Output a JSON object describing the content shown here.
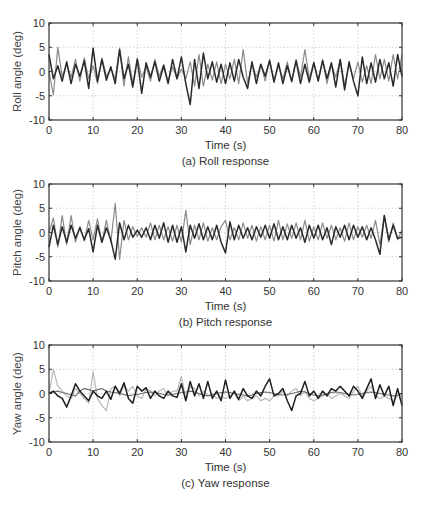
{
  "chart_data": [
    {
      "type": "line",
      "title": "(a) Roll response",
      "xlabel": "Time (s)",
      "ylabel": "Roll angle (deg)",
      "xlim": [
        0,
        80
      ],
      "ylim": [
        -10,
        10
      ],
      "xticks": [
        0,
        10,
        20,
        30,
        40,
        50,
        60,
        70,
        80
      ],
      "yticks": [
        10,
        5,
        0,
        -5,
        -10
      ],
      "grid": true,
      "x": [
        0,
        1,
        2,
        3,
        4,
        5,
        6,
        7,
        8,
        9,
        10,
        11,
        12,
        13,
        14,
        15,
        16,
        17,
        18,
        19,
        20,
        21,
        22,
        23,
        24,
        25,
        26,
        27,
        28,
        29,
        30,
        31,
        32,
        33,
        34,
        35,
        36,
        37,
        38,
        39,
        40,
        41,
        42,
        43,
        44,
        45,
        46,
        47,
        48,
        49,
        50,
        51,
        52,
        53,
        54,
        55,
        56,
        57,
        58,
        59,
        60,
        61,
        62,
        63,
        64,
        65,
        66,
        67,
        68,
        69,
        70,
        71,
        72,
        73,
        74,
        75,
        76,
        77,
        78,
        79,
        80
      ],
      "series": [
        {
          "name": "series-1",
          "color": "#2a2a2a",
          "values": [
            3.5,
            -1.5,
            1.2,
            -2,
            2,
            -2.5,
            1.5,
            -1,
            2.2,
            -3.5,
            4.8,
            -2,
            2.5,
            -1.8,
            1,
            -2.5,
            4.5,
            -1.5,
            1.5,
            -3.2,
            2.5,
            -4.5,
            1.8,
            -1.2,
            2,
            -2,
            1.2,
            -2.5,
            2.5,
            -1.5,
            3,
            -2.5,
            -6.8,
            2.5,
            -3.5,
            3.8,
            -1.5,
            2,
            -2.2,
            1.5,
            -2.5,
            1.8,
            -2,
            2.5,
            -1.2,
            -3.5,
            2,
            -2.5,
            1.5,
            -1,
            2.2,
            -2.2,
            1.8,
            -2.5,
            1.2,
            -2,
            2.2,
            -2.5,
            1.5,
            -2.2,
            1.8,
            -2,
            2.2,
            -1.5,
            1.8,
            -3.2,
            2.5,
            -3.8,
            2,
            -2,
            -5,
            3,
            -2.5,
            1.8,
            -2.2,
            2.5,
            -1.5,
            1.8,
            -3,
            3.5,
            -1
          ]
        },
        {
          "name": "series-2",
          "color": "#8a8a8a",
          "values": [
            0,
            -4.8,
            5,
            -1,
            1.5,
            -1.2,
            2.5,
            -2,
            2.8,
            -1.5,
            1.2,
            -2.5,
            2.8,
            -1,
            0.5,
            -1.5,
            4.8,
            -3,
            3,
            -2.5,
            2.8,
            -1.2,
            1,
            -2,
            2.5,
            -1,
            1.5,
            -2,
            1,
            -1.5,
            0.5,
            -1.5,
            2,
            -3,
            3.5,
            -3,
            1.5,
            -1.8,
            2,
            -2.5,
            1.5,
            -1.5,
            2.5,
            -2.5,
            4.5,
            -2.5,
            1.8,
            -1.2,
            1.5,
            -2,
            2.5,
            -1.8,
            1.2,
            -1.5,
            2,
            -2.2,
            2.5,
            -1.2,
            4.5,
            -1.5,
            2,
            -1.8,
            2.5,
            -2.5,
            1.5,
            -1.2,
            2.5,
            -2.8,
            1.5,
            -1.5,
            2,
            -2.2,
            1.2,
            -2.5,
            3.5,
            -1.5,
            2.5,
            -2,
            3.5,
            -1.5,
            3.5
          ]
        }
      ]
    },
    {
      "type": "line",
      "title": "(b) Pitch response",
      "xlabel": "Time (s)",
      "ylabel": "Pitch angle (deg)",
      "xlim": [
        0,
        80
      ],
      "ylim": [
        -10,
        10
      ],
      "xticks": [
        0,
        10,
        20,
        30,
        40,
        50,
        60,
        70,
        80
      ],
      "yticks": [
        10,
        5,
        0,
        -5,
        -10
      ],
      "grid": true,
      "x": [
        0,
        1,
        2,
        3,
        4,
        5,
        6,
        7,
        8,
        9,
        10,
        11,
        12,
        13,
        14,
        15,
        16,
        17,
        18,
        19,
        20,
        21,
        22,
        23,
        24,
        25,
        26,
        27,
        28,
        29,
        30,
        31,
        32,
        33,
        34,
        35,
        36,
        37,
        38,
        39,
        40,
        41,
        42,
        43,
        44,
        45,
        46,
        47,
        48,
        49,
        50,
        51,
        52,
        53,
        54,
        55,
        56,
        57,
        58,
        59,
        60,
        61,
        62,
        63,
        64,
        65,
        66,
        67,
        68,
        69,
        70,
        71,
        72,
        73,
        74,
        75,
        76,
        77,
        78,
        79,
        80
      ],
      "series": [
        {
          "name": "series-1",
          "color": "#2a2a2a",
          "values": [
            -3,
            1.5,
            -2.5,
            1.2,
            -2,
            1.5,
            -1.2,
            1,
            -1.5,
            0.8,
            -4,
            1.5,
            -2,
            1,
            -1.5,
            -5.5,
            2,
            -1.5,
            1.5,
            -1,
            0.5,
            -1,
            1,
            -1.5,
            1.5,
            -1.2,
            2,
            -2,
            1.5,
            -2,
            1.2,
            -4,
            1.5,
            -1.2,
            1.8,
            -1.5,
            1.2,
            -1.5,
            1.5,
            -2,
            -4.2,
            2.2,
            -1.5,
            1.5,
            -1.2,
            1,
            -1.5,
            1.2,
            -1,
            1.5,
            -1.2,
            1.8,
            -1.5,
            1.2,
            -1.5,
            1.5,
            -1.2,
            1,
            -2,
            1.5,
            -1.2,
            1.5,
            -1.5,
            1,
            -2.5,
            1.2,
            -1,
            1.5,
            -1.5,
            1.5,
            -1,
            1.2,
            -1.5,
            1,
            -1.5,
            -4.5,
            3.5,
            -1.5,
            1.5,
            -1.2,
            -1
          ]
        },
        {
          "name": "series-2",
          "color": "#8a8a8a",
          "values": [
            0,
            3,
            -3,
            3.5,
            -2.5,
            3.5,
            -2,
            1.2,
            -1.8,
            2.5,
            -1.5,
            2.8,
            -2,
            2.5,
            -2,
            6,
            -5.5,
            2.5,
            -1.5,
            1.2,
            -0.8,
            1,
            -1,
            2,
            -1.5,
            1.5,
            -1.5,
            1.2,
            -1.8,
            1.5,
            -2,
            4.5,
            -2.5,
            1.5,
            -1.5,
            2,
            -1.8,
            1,
            -1.5,
            1.2,
            2.5,
            -1.5,
            1,
            -1.5,
            2,
            -1.2,
            1.5,
            -1.8,
            1.2,
            -1.5,
            1.5,
            -1.8,
            2.5,
            -1.5,
            1.8,
            -1.2,
            2,
            -1.5,
            2.5,
            -1.8,
            1.2,
            -1.5,
            2,
            -1.2,
            1.5,
            -1.5,
            1,
            -1.8,
            2,
            -1.5,
            1.2,
            -1,
            1.5,
            -1.2,
            2.5,
            -2.5,
            3.5,
            -2,
            2,
            -1.5,
            0.5
          ]
        }
      ]
    },
    {
      "type": "line",
      "title": "(c) Yaw response",
      "xlabel": "Time (s)",
      "ylabel": "Yaw angle (deg)",
      "xlim": [
        0,
        80
      ],
      "ylim": [
        -10,
        10
      ],
      "xticks": [
        0,
        10,
        20,
        30,
        40,
        50,
        60,
        70,
        80
      ],
      "yticks": [
        10,
        5,
        0,
        -5,
        -10
      ],
      "grid": true,
      "x": [
        0,
        1,
        2,
        3,
        4,
        5,
        6,
        7,
        8,
        9,
        10,
        11,
        12,
        13,
        14,
        15,
        16,
        17,
        18,
        19,
        20,
        21,
        22,
        23,
        24,
        25,
        26,
        27,
        28,
        29,
        30,
        31,
        32,
        33,
        34,
        35,
        36,
        37,
        38,
        39,
        40,
        41,
        42,
        43,
        44,
        45,
        46,
        47,
        48,
        49,
        50,
        51,
        52,
        53,
        54,
        55,
        56,
        57,
        58,
        59,
        60,
        61,
        62,
        63,
        64,
        65,
        66,
        67,
        68,
        69,
        70,
        71,
        72,
        73,
        74,
        75,
        76,
        77,
        78,
        79,
        80
      ],
      "series": [
        {
          "name": "series-1",
          "color": "#1e1e1e",
          "values": [
            0,
            0.5,
            -0.5,
            -1,
            -2.8,
            -0.5,
            2,
            0.5,
            -0.5,
            -1.5,
            0.5,
            -0.5,
            -1,
            0.5,
            -1.2,
            1.5,
            0,
            2.2,
            -1,
            -2,
            1.5,
            0.5,
            1.2,
            -1,
            0.5,
            -0.5,
            -1,
            0.5,
            -0.5,
            -0.8,
            2,
            -1.5,
            2.5,
            -0.5,
            2,
            -1,
            2.5,
            -1,
            0.5,
            -1.5,
            2.8,
            -1,
            0.5,
            -1.2,
            1,
            -0.5,
            -1,
            0.5,
            -0.5,
            1.5,
            3,
            -0.5,
            0,
            1,
            -1.5,
            -3.5,
            -0.5,
            0,
            2.5,
            -0.5,
            0.5,
            -1,
            0.5,
            -0.5,
            1,
            0.5,
            1.5,
            0.5,
            -0.5,
            1.5,
            0.5,
            -1,
            1,
            3,
            -1,
            1.8,
            -0.5,
            1.5,
            -2.5,
            1,
            -2.5
          ]
        },
        {
          "name": "series-2",
          "color": "#6e6e6e",
          "values": [
            0,
            0.3,
            0.5,
            0.2,
            0,
            -0.3,
            -0.5,
            0.5,
            1,
            0.8,
            0.5,
            0.8,
            1,
            0.5,
            0.3,
            0.2,
            0,
            -0.2,
            -0.5,
            -0.3,
            -0.2,
            0,
            0.2,
            0.3,
            0.2,
            0,
            -0.2,
            -0.3,
            -0.2,
            0,
            0.2,
            0.3,
            0.5,
            0.3,
            0,
            -0.3,
            -0.5,
            -0.3,
            0,
            0.2,
            0.3,
            0.2,
            0,
            -0.2,
            -0.3,
            -0.5,
            -0.3,
            0,
            0.2,
            0.3,
            0.2,
            0,
            -0.2,
            -0.3,
            -0.2,
            0,
            0.2,
            0.5,
            0.3,
            0,
            -0.3,
            -0.5,
            -0.3,
            0,
            0.2,
            0.3,
            0.2,
            0,
            -0.2,
            -0.3,
            -0.2,
            0,
            0.2,
            0.3,
            0.2,
            0,
            -0.2,
            -0.3,
            -0.5,
            -0.3,
            0
          ]
        },
        {
          "name": "series-3",
          "color": "#b8b8b8",
          "values": [
            0,
            5,
            1.5,
            0.5,
            -0.5,
            -1,
            1,
            0,
            -1,
            -2,
            4.5,
            -1,
            -2.5,
            -3.5,
            1,
            1.5,
            -0.5,
            1.5,
            0.5,
            1.5,
            -0.5,
            -1,
            1,
            0.5,
            -0.5,
            0.5,
            1,
            -0.5,
            0.5,
            0.5,
            3.5,
            -1,
            1.5,
            1,
            -0.5,
            0.5,
            -0.5,
            0,
            -1,
            -0.5,
            -1,
            -0.5,
            0,
            -1.5,
            -0.5,
            -1.5,
            -1,
            -0.5,
            -1.5,
            -1,
            -1.5,
            -0.5,
            -0.5,
            0.5,
            -0.5,
            0.5,
            1,
            -0.5,
            0.5,
            -1,
            -1.5,
            -1,
            -0.5,
            0,
            -1,
            -0.5,
            0,
            -0.5,
            -1,
            0.5,
            1.5,
            -0.5,
            0.5,
            1.5,
            -0.5,
            -1,
            -0.5,
            -1,
            -1.5,
            -0.5,
            -0.5
          ]
        }
      ]
    }
  ]
}
